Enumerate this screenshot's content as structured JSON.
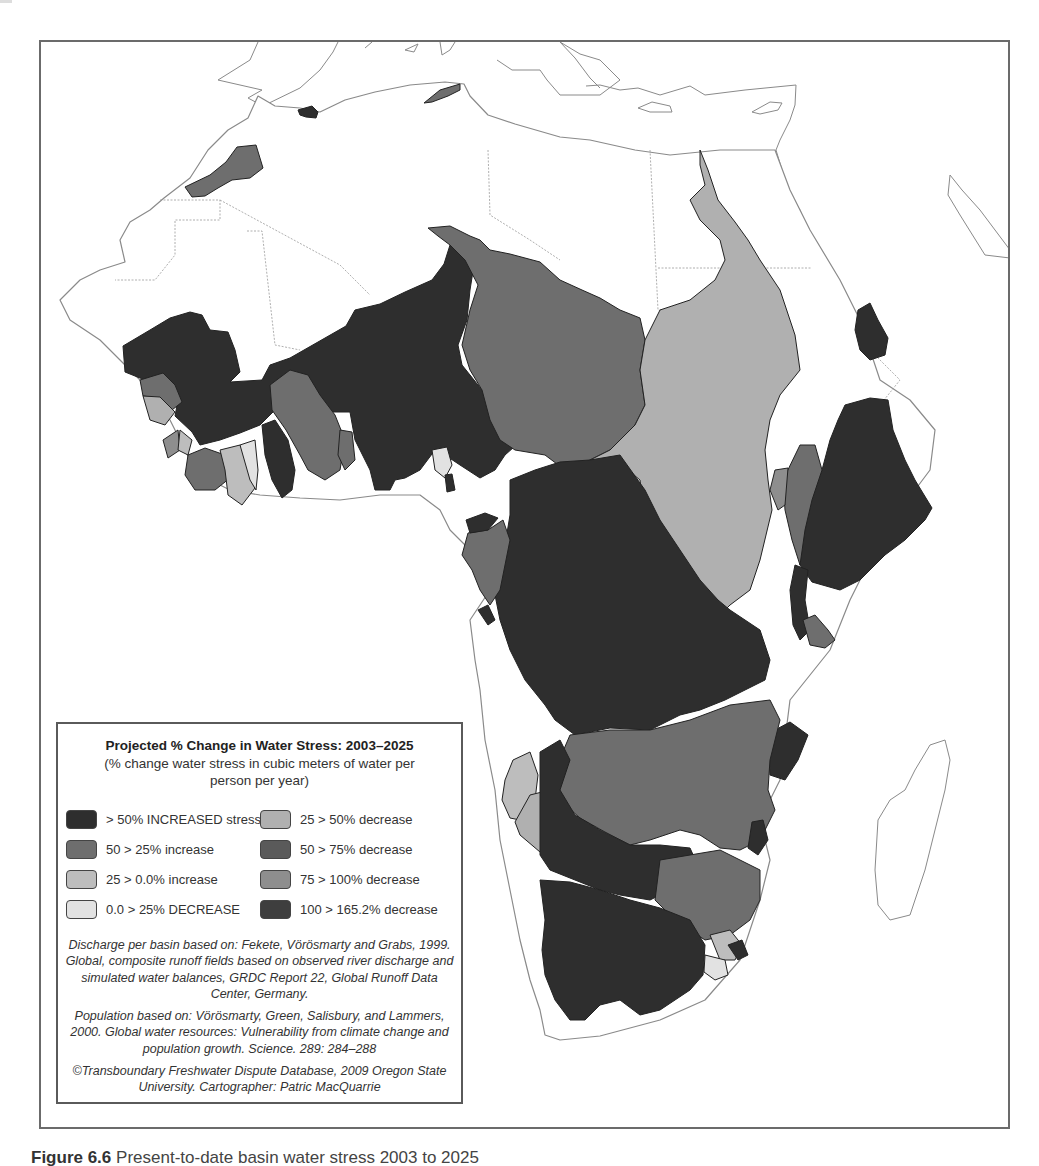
{
  "map": {
    "title": "Projected % Change in Water Stress: 2003–2025",
    "subtitle": "(% change water stress in cubic meters of water per person per year)",
    "region": "Africa",
    "colors": {
      "gt50_increased": "#2e2e2e",
      "50_25_increase": "#6e6e6e",
      "25_0_increase": "#bdbdbd",
      "0_25_decrease": "#e2e2e2",
      "25_50_decrease": "#b0b0b0",
      "50_75_decrease": "#5a5a5a",
      "75_100_decrease": "#8e8e8e",
      "100_165_decrease": "#3e3e3e",
      "land": "#ffffff",
      "outline": "#8a8a8a"
    }
  },
  "legend": {
    "title": "Projected % Change in Water Stress: 2003–2025",
    "subtitle": "(% change water stress in cubic meters of water per person per year)",
    "items": [
      {
        "label": "> 50% INCREASED stress",
        "color": "#2e2e2e"
      },
      {
        "label": "25 > 50% decrease",
        "color": "#b0b0b0"
      },
      {
        "label": "50 > 25% increase",
        "color": "#6e6e6e"
      },
      {
        "label": "50 > 75% decrease",
        "color": "#5a5a5a"
      },
      {
        "label": "25 > 0.0% increase",
        "color": "#bdbdbd"
      },
      {
        "label": "75 > 100% decrease",
        "color": "#8e8e8e"
      },
      {
        "label": "0.0 > 25% DECREASE",
        "color": "#e2e2e2"
      },
      {
        "label": "100 > 165.2% decrease",
        "color": "#3e3e3e"
      }
    ],
    "credits": [
      "Discharge per basin based on: Fekete, Vörösmarty and Grabs, 1999. Global, composite runoff fields based on observed river discharge and simulated water balances, GRDC Report 22, Global Runoff Data Center, Germany.",
      "Population based on: Vörösmarty, Green, Salisbury, and Lammers, 2000. Global water resources: Vulnerability from climate change and population growth. Science. 289: 284–288",
      "©Transboundary Freshwater Dispute Database, 2009 Oregon State University. Cartographer: Patric MacQuarrie"
    ]
  },
  "caption": {
    "figure_label": "Figure 6.6",
    "text": "Present-to-date basin water stress 2003 to 2025"
  }
}
